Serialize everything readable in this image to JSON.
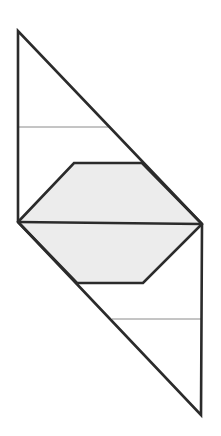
{
  "diagram": {
    "colors": {
      "stroke": "#2b2b2b",
      "thin_line": "#8a8a8a",
      "fill": "#ececec",
      "background": "#ffffff"
    },
    "vertices": {
      "top": [
        18,
        31
      ],
      "left_mid": [
        18,
        222
      ],
      "right_mid": [
        202,
        224
      ],
      "bottom": [
        201,
        415
      ]
    },
    "hexagon": {
      "points": [
        [
          18,
          222
        ],
        [
          74,
          163
        ],
        [
          142,
          163
        ],
        [
          202,
          224
        ],
        [
          143,
          283
        ],
        [
          77,
          283
        ]
      ]
    },
    "thin_lines": [
      {
        "from": [
          18,
          127
        ],
        "to": [
          108,
          127
        ]
      },
      {
        "from": [
          112,
          319
        ],
        "to": [
          201,
          319
        ]
      }
    ]
  }
}
